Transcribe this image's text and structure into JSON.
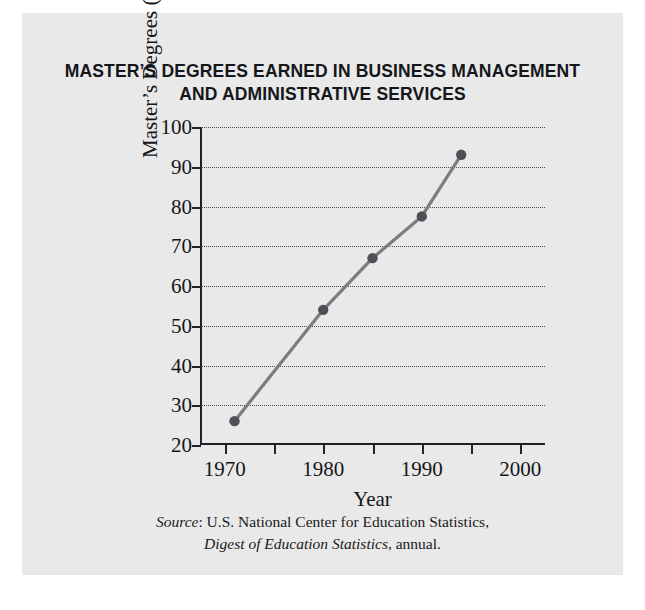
{
  "title": {
    "line1": "MASTER’S DEGREES EARNED IN BUSINESS MANAGEMENT",
    "line2": "AND ADMINISTRATIVE SERVICES"
  },
  "source": {
    "label": "Source",
    "line1_rest": ": U.S. National Center for Education Statistics,",
    "line2_italic": "Digest of Education Statistics",
    "line2_rest": ", annual."
  },
  "colors": {
    "page_background": "#e9e9e9",
    "outer_background": "#ffffff",
    "axis": "#20222a",
    "gridline": "#4a4c52",
    "series_line": "#7b7d83",
    "marker": "#4e5055",
    "text": "#15161a"
  },
  "chart_data": {
    "type": "line",
    "title": "MASTER’S DEGREES EARNED IN BUSINESS MANAGEMENT AND ADMINISTRATIVE SERVICES",
    "xlabel": "Year",
    "ylabel": "Master’s Degrees (in thousands)",
    "xlim": [
      1967.5,
      2002.5
    ],
    "ylim": [
      20,
      100
    ],
    "grid": true,
    "legend": null,
    "x_tick_labels": [
      "1970",
      "1980",
      "1990",
      "2000"
    ],
    "x_tick_values": [
      1970,
      1980,
      1990,
      2000
    ],
    "x_minor_ticks": [
      1970,
      1975,
      1980,
      1985,
      1990,
      1995,
      2000
    ],
    "y_tick_labels": [
      "20",
      "30",
      "40",
      "50",
      "60",
      "70",
      "80",
      "90",
      "100"
    ],
    "y_tick_values": [
      20,
      30,
      40,
      50,
      60,
      70,
      80,
      90,
      100
    ],
    "series": [
      {
        "name": "Master’s degrees in business management and administrative services",
        "x": [
          1971,
          1980,
          1985,
          1990,
          1994
        ],
        "values": [
          26,
          54,
          67,
          77.5,
          93
        ]
      }
    ]
  }
}
